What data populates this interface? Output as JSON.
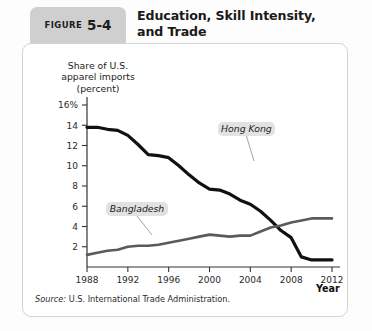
{
  "figure": {
    "badge_word": "FIGURE",
    "badge_number": "5-4",
    "title": "Education, Skill Intensity, and Trade",
    "title_line1": "Education, Skill Intensity,",
    "title_line2": "and Trade",
    "source_label": "Source:",
    "source_text": "U.S. International Trade Administration."
  },
  "colors": {
    "badge_bg": "#cfcfcf",
    "panel_bg": "#ffffff",
    "panel_border": "#d3d3d3",
    "hong_kong_line": "#111111",
    "bangladesh_line": "#5a5a5a",
    "axis": "#333333",
    "callout_bg": "#e2e2e2",
    "text": "#1a1a1a"
  },
  "chart_data": {
    "type": "line",
    "title": "Education, Skill Intensity, and Trade",
    "ylabel": "Share of U.S. apparel imports (percent)",
    "ylabel_line1": "Share of U.S.",
    "ylabel_line2": "apparel imports",
    "ylabel_line3": "(percent)",
    "xlabel": "Year",
    "xlim": [
      1988,
      2012
    ],
    "ylim": [
      0,
      16
    ],
    "grid": false,
    "legend_position": "inline-callout",
    "xticks": [
      1988,
      1992,
      1996,
      2000,
      2004,
      2008,
      2012
    ],
    "xtick_labels": [
      "1988",
      "1992",
      "1996",
      "2000",
      "2004",
      "2008",
      "2012"
    ],
    "yticks": [
      2,
      4,
      6,
      8,
      10,
      12,
      14,
      16
    ],
    "ytick_labels": [
      "2",
      "4",
      "6",
      "8",
      "10",
      "12",
      "14",
      "16%"
    ],
    "x": [
      1988,
      1989,
      1990,
      1991,
      1992,
      1993,
      1994,
      1995,
      1996,
      1997,
      1998,
      1999,
      2000,
      2001,
      2002,
      2003,
      2004,
      2005,
      2006,
      2007,
      2008,
      2009,
      2010,
      2011,
      2012
    ],
    "series": [
      {
        "name": "Hong Kong",
        "color": "#111111",
        "values": [
          13.8,
          13.8,
          13.6,
          13.5,
          13.0,
          12.1,
          11.1,
          11.0,
          10.8,
          10.0,
          9.1,
          8.3,
          7.7,
          7.6,
          7.2,
          6.6,
          6.2,
          5.5,
          4.6,
          3.6,
          2.9,
          1.0,
          0.7,
          0.7,
          0.7
        ],
        "label_text": "Hong Kong",
        "label_x": 2000,
        "label_y": 12.2
      },
      {
        "name": "Bangladesh",
        "color": "#5a5a5a",
        "values": [
          1.2,
          1.4,
          1.6,
          1.7,
          2.0,
          2.1,
          2.1,
          2.2,
          2.4,
          2.6,
          2.8,
          3.0,
          3.2,
          3.1,
          3.0,
          3.1,
          3.1,
          3.5,
          3.9,
          4.1,
          4.4,
          4.6,
          4.8,
          4.8,
          4.8
        ],
        "label_text": "Bangladesh",
        "label_x": 1994,
        "label_y": 5.6
      }
    ]
  }
}
